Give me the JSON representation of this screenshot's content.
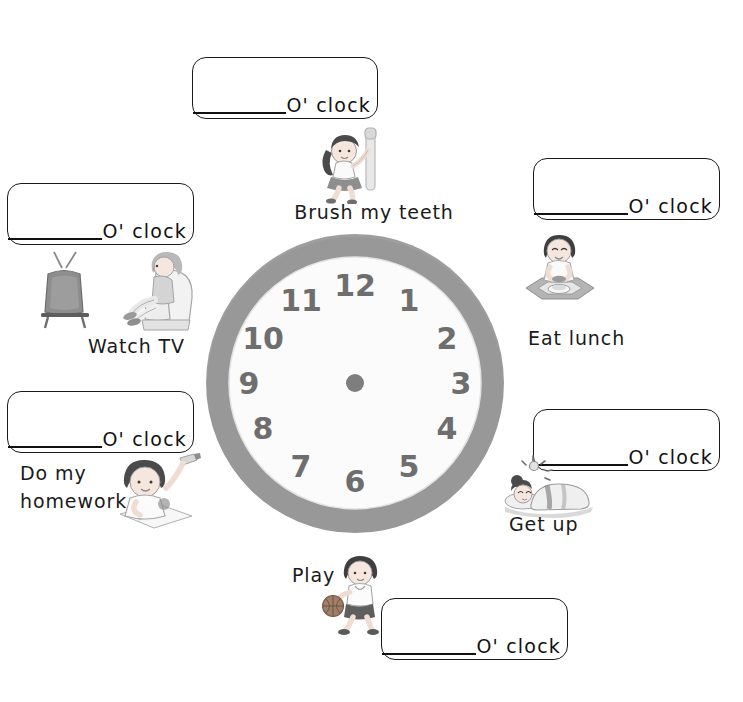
{
  "worksheet": {
    "title": "Daily Routine Clock Worksheet",
    "blank_label": "O' clock"
  },
  "clock": {
    "name": "analog-clock",
    "numerals": [
      "12",
      "1",
      "2",
      "3",
      "4",
      "5",
      "6",
      "7",
      "8",
      "9",
      "10",
      "11"
    ],
    "bezel_color": "#9a9a9a",
    "face_color": "#fbfbfb",
    "numeral_color": "#6e6e6e",
    "center_dot_color": "#7a7a7a",
    "has_hands": false
  },
  "activities": [
    {
      "id": "brush-my-teeth",
      "caption": "Brush my teeth",
      "blank_label": "O' clock",
      "icon": "girl-with-toothbrush-icon"
    },
    {
      "id": "eat-lunch",
      "caption": "Eat lunch",
      "blank_label": "O' clock",
      "icon": "child-eating-at-table-icon"
    },
    {
      "id": "get-up",
      "caption": "Get up",
      "blank_label": "O' clock",
      "icon": "child-sleeping-with-alarm-icon"
    },
    {
      "id": "play",
      "caption": "Play",
      "blank_label": "O' clock",
      "icon": "boy-with-basketball-icon"
    },
    {
      "id": "do-my-homework",
      "caption": "Do my\nhomework",
      "blank_label": "O' clock",
      "icon": "boy-doing-homework-icon"
    },
    {
      "id": "watch-tv",
      "caption": "Watch TV",
      "blank_label": "O' clock",
      "icon": "tv-and-person-in-armchair-icon"
    }
  ]
}
